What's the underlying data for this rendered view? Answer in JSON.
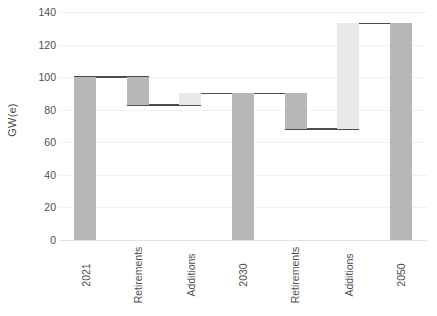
{
  "chart_data": {
    "type": "bar",
    "subtype": "waterfall",
    "title": "",
    "xlabel": "",
    "ylabel": "GW(e)",
    "ylim": [
      0,
      140
    ],
    "ytick_labels": [
      "0",
      "20",
      "40",
      "60",
      "80",
      "100",
      "120",
      "140"
    ],
    "yticks": [
      0,
      20,
      40,
      60,
      80,
      100,
      120,
      140
    ],
    "grid": true,
    "legend": false,
    "categories": [
      "2021",
      "Retirements",
      "Additions",
      "2030",
      "Retirements",
      "Additions",
      "2050"
    ],
    "values": [
      100,
      -17,
      7,
      90,
      -22,
      65,
      133
    ],
    "cumulative": [
      100,
      83,
      90,
      90,
      68,
      133,
      133
    ],
    "bars": [
      {
        "label": "2021",
        "kind": "total",
        "base": 0,
        "top": 100,
        "value": 100,
        "color": "#b7b7b7"
      },
      {
        "label": "Retirements",
        "kind": "decrease",
        "base": 83,
        "top": 100,
        "value": -17,
        "color": "#b7b7b7"
      },
      {
        "label": "Additions",
        "kind": "increase",
        "base": 83,
        "top": 90,
        "value": 7,
        "color": "#e9e9e9"
      },
      {
        "label": "2030",
        "kind": "total",
        "base": 0,
        "top": 90,
        "value": 90,
        "color": "#b7b7b7"
      },
      {
        "label": "Retirements",
        "kind": "decrease",
        "base": 68,
        "top": 90,
        "value": -22,
        "color": "#b7b7b7"
      },
      {
        "label": "Additions",
        "kind": "increase",
        "base": 68,
        "top": 133,
        "value": 65,
        "color": "#e9e9e9"
      },
      {
        "label": "2050",
        "kind": "total",
        "base": 0,
        "top": 133,
        "value": 133,
        "color": "#b7b7b7"
      }
    ],
    "connectors": [
      {
        "from_bar": 0,
        "to_bar": 1,
        "level": 100
      },
      {
        "from_bar": 1,
        "to_bar": 2,
        "level": 83
      },
      {
        "from_bar": 2,
        "to_bar": 3,
        "level": 90
      },
      {
        "from_bar": 3,
        "to_bar": 4,
        "level": 90
      },
      {
        "from_bar": 4,
        "to_bar": 5,
        "level": 68
      },
      {
        "from_bar": 5,
        "to_bar": 6,
        "level": 133
      }
    ],
    "colors": {
      "bar_dark": "#b7b7b7",
      "bar_light": "#e9e9e9",
      "connector": "#4d4d4d",
      "gridline": "#f0f0f0",
      "text": "#4f4f4f",
      "background": "#ffffff"
    }
  }
}
